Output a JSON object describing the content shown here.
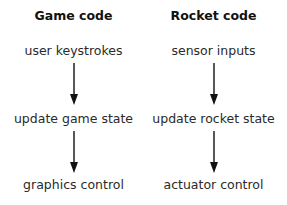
{
  "columns": [
    {
      "title": "Game code",
      "steps": [
        "user keystrokes",
        "update game state",
        "graphics control"
      ]
    },
    {
      "title": "Rocket code",
      "steps": [
        "sensor inputs",
        "update rocket state",
        "actuator control"
      ]
    }
  ],
  "colors": {
    "text": "#222222",
    "arrow": "#111111",
    "background": "#ffffff"
  }
}
